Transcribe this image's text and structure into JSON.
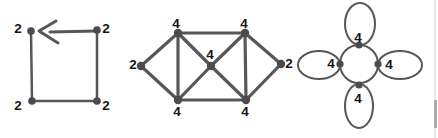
{
  "figure": {
    "width": 438,
    "height": 138,
    "background": "#ffffff"
  },
  "palette": {
    "ink": "#57575a",
    "node": "#4b4b4d",
    "label": "#151515",
    "scan_light": "#e7e7e7",
    "scan_dark": "#ababab"
  },
  "graphs": [
    {
      "id": "directed-square-cycle",
      "caption_semantics": "4-cycle, every vertex degree 2, arrow shows traversal direction",
      "stroke_width": 2.5,
      "node_radius": 3.8,
      "label_size": 13.5,
      "nodes": [
        {
          "id": "tl",
          "x": 31,
          "y": 31,
          "label": "2",
          "lx": 18,
          "ly": 28
        },
        {
          "id": "tr",
          "x": 97,
          "y": 30,
          "label": "2",
          "lx": 106,
          "ly": 28
        },
        {
          "id": "bl",
          "x": 32,
          "y": 101,
          "label": "2",
          "lx": 18,
          "ly": 105
        },
        {
          "id": "br",
          "x": 97,
          "y": 101,
          "label": "2",
          "lx": 106,
          "ly": 105
        }
      ],
      "edges": [
        [
          "tl",
          "bl"
        ],
        [
          "bl",
          "br"
        ],
        [
          "br",
          "tr"
        ]
      ],
      "arrows": [
        {
          "shaft": [
            [
              97,
              31
            ],
            [
              50,
              32
            ]
          ],
          "head": [
            [
              56,
              21
            ],
            [
              39,
              31
            ],
            [
              58,
              43
            ]
          ],
          "width": 3
        }
      ]
    },
    {
      "id": "octahedron-like-graph",
      "caption_semantics": "Graph with degrees 2,4,4,4,4,4,2",
      "stroke_width": 3.2,
      "node_radius": 4.2,
      "label_size": 13.5,
      "nodes": [
        {
          "id": "l",
          "x": 141,
          "y": 66,
          "label": "2",
          "lx": 133,
          "ly": 64
        },
        {
          "id": "tl",
          "x": 178,
          "y": 33,
          "label": "4",
          "lx": 176,
          "ly": 23
        },
        {
          "id": "tr",
          "x": 245,
          "y": 33,
          "label": "4",
          "lx": 244,
          "ly": 23
        },
        {
          "id": "bl",
          "x": 178,
          "y": 100,
          "label": "4",
          "lx": 177,
          "ly": 111
        },
        {
          "id": "br",
          "x": 246,
          "y": 100,
          "label": "4",
          "lx": 245,
          "ly": 111
        },
        {
          "id": "c",
          "x": 211,
          "y": 66,
          "label": "4",
          "lx": 210,
          "ly": 54
        },
        {
          "id": "r",
          "x": 281,
          "y": 64,
          "label": "2",
          "lx": 289,
          "ly": 63
        }
      ],
      "edges": [
        [
          "l",
          "tl"
        ],
        [
          "l",
          "bl"
        ],
        [
          "tl",
          "tr"
        ],
        [
          "bl",
          "br"
        ],
        [
          "tl",
          "bl"
        ],
        [
          "tr",
          "br"
        ],
        [
          "tl",
          "c"
        ],
        [
          "c",
          "br"
        ],
        [
          "tr",
          "c"
        ],
        [
          "c",
          "bl"
        ],
        [
          "r",
          "tr"
        ],
        [
          "r",
          "br"
        ]
      ],
      "arrows": []
    },
    {
      "id": "cycle-with-four-loops",
      "caption_semantics": "Central 4-cycle circle, one self-loop at each vertex, every vertex degree 4",
      "stroke_width": 2,
      "node_radius": 3.6,
      "label_size": 13.5,
      "circle": {
        "cx": 359,
        "cy": 64,
        "r": 19
      },
      "loops": [
        {
          "cx": 360,
          "cy": 24,
          "rx": 15,
          "ry": 21
        },
        {
          "cx": 319,
          "cy": 65,
          "rx": 21,
          "ry": 14
        },
        {
          "cx": 400,
          "cy": 65,
          "rx": 22,
          "ry": 14
        },
        {
          "cx": 359,
          "cy": 106,
          "rx": 14,
          "ry": 22
        }
      ],
      "nodes": [
        {
          "id": "n",
          "x": 359,
          "y": 45,
          "label": "4",
          "lx": 358,
          "ly": 37
        },
        {
          "id": "w",
          "x": 340,
          "y": 64,
          "label": "4",
          "lx": 331,
          "ly": 63
        },
        {
          "id": "e",
          "x": 378,
          "y": 64,
          "label": "4",
          "lx": 389,
          "ly": 64
        },
        {
          "id": "s",
          "x": 359,
          "y": 85,
          "label": "4",
          "lx": 358,
          "ly": 98
        }
      ],
      "edges": [],
      "arrows": []
    }
  ],
  "scan_artifact": {
    "x": 434,
    "light_width": 2,
    "dark_y": 100,
    "dark_h": 28,
    "dark_width": 3
  }
}
